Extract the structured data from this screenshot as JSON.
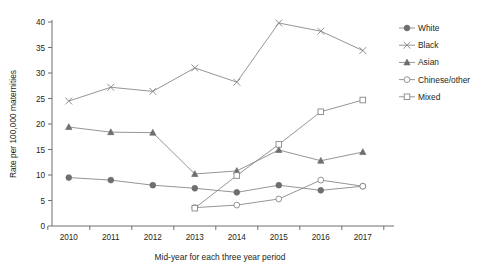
{
  "chart_data": {
    "type": "line",
    "title": "",
    "xlabel": "Mid-year for each three year period",
    "ylabel": "Rate per 100,000 maternities",
    "x": [
      2010,
      2011,
      2012,
      2013,
      2014,
      2015,
      2016,
      2017
    ],
    "xtick_labels": [
      "2010",
      "2011",
      "2012",
      "2013",
      "2014",
      "2015",
      "2016",
      "2017"
    ],
    "ytick_labels": [
      "0",
      "5",
      "10",
      "15",
      "20",
      "25",
      "30",
      "35",
      "40"
    ],
    "yticks": [
      0,
      5,
      10,
      15,
      20,
      25,
      30,
      35,
      40
    ],
    "ylim": [
      0,
      40
    ],
    "xlim": [
      2009.6,
      2017.6
    ],
    "grid": false,
    "legend_position": "right",
    "series": [
      {
        "name": "White",
        "marker": "filled-circle",
        "color": "#6d6e71",
        "x": [
          2010,
          2011,
          2012,
          2013,
          2014,
          2015,
          2016,
          2017
        ],
        "values": [
          9.5,
          9.0,
          8.0,
          7.4,
          6.6,
          8.0,
          7.0,
          7.8
        ]
      },
      {
        "name": "Black",
        "marker": "cross-x",
        "color": "#808285",
        "x": [
          2010,
          2011,
          2012,
          2013,
          2014,
          2015,
          2016,
          2017
        ],
        "values": [
          24.5,
          27.2,
          26.4,
          31.0,
          28.2,
          39.8,
          38.2,
          34.4
        ]
      },
      {
        "name": "Asian",
        "marker": "filled-triangle",
        "color": "#6d6e71",
        "x": [
          2010,
          2011,
          2012,
          2013,
          2014,
          2015,
          2016,
          2017
        ],
        "values": [
          19.4,
          18.4,
          18.3,
          10.2,
          10.8,
          14.9,
          12.8,
          14.5
        ]
      },
      {
        "name": "Chinese/other",
        "marker": "open-circle",
        "color": "#808285",
        "x": [
          2013,
          2014,
          2015,
          2016,
          2017
        ],
        "values": [
          3.6,
          4.1,
          5.3,
          9.0,
          7.8
        ]
      },
      {
        "name": "Mixed",
        "marker": "open-square",
        "color": "#808285",
        "x": [
          2013,
          2014,
          2015,
          2016,
          2017
        ],
        "values": [
          3.5,
          9.9,
          16.0,
          22.4,
          24.7
        ]
      }
    ]
  },
  "legend": {
    "items": [
      {
        "label": "White"
      },
      {
        "label": "Black"
      },
      {
        "label": "Asian"
      },
      {
        "label": "Chinese/other"
      },
      {
        "label": "Mixed"
      }
    ]
  }
}
